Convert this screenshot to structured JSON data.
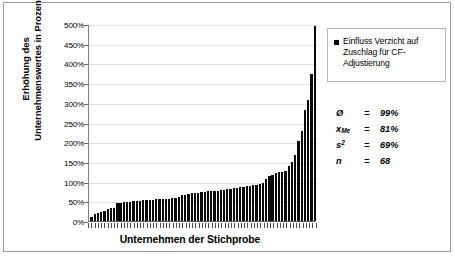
{
  "chart_data": {
    "type": "bar",
    "title": "",
    "xlabel": "Unternehmen der Stichprobe",
    "ylabel_lines": [
      "Erhöhung des",
      "Unternehmenswertes in Prozent"
    ],
    "ylabel": "Erhöhung des Unternehmenswertes in Prozent",
    "ylim": [
      0,
      500
    ],
    "ytick_labels": [
      "500%",
      "450%",
      "400%",
      "350%",
      "300%",
      "250%",
      "200%",
      "150%",
      "100%",
      "50%",
      "0%"
    ],
    "ytick_values": [
      500,
      450,
      400,
      350,
      300,
      250,
      200,
      150,
      100,
      50,
      0
    ],
    "ytick_suffix": "%",
    "grid": true,
    "legend_position": "right",
    "series": [
      {
        "name": "Einfluss Verzicht auf Zuschlag für CF-Adjustierung",
        "color": "#0a0a0a",
        "values": [
          11,
          17,
          21,
          24,
          25,
          31,
          32,
          33,
          45,
          46,
          47,
          48,
          49,
          50,
          51,
          52,
          53,
          53,
          54,
          54,
          55,
          55,
          56,
          56,
          57,
          58,
          59,
          61,
          66,
          67,
          68,
          70,
          71,
          72,
          73,
          74,
          75,
          76,
          76,
          77,
          78,
          79,
          80,
          81,
          83,
          85,
          86,
          87,
          88,
          89,
          91,
          92,
          94,
          97,
          106,
          113,
          118,
          121,
          124,
          125,
          126,
          139,
          151,
          168,
          203,
          228,
          283,
          307,
          372,
          495
        ]
      }
    ],
    "n_bars": 68
  },
  "legend": {
    "entry_label": "Einfluss Verzicht auf Zuschlag für CF-Adjustierung",
    "marker_color": "#000000"
  },
  "stats": {
    "rows": [
      {
        "symbol": "Ø",
        "sub": "",
        "sup": "",
        "equals": "=",
        "value": "99%"
      },
      {
        "symbol": "x",
        "sub": "Me",
        "sup": "",
        "equals": "=",
        "value": "81%"
      },
      {
        "symbol": "s",
        "sub": "",
        "sup": "2",
        "equals": "=",
        "value": "69%"
      },
      {
        "symbol": "n",
        "sub": "",
        "sup": "",
        "equals": "=",
        "value": "68"
      }
    ]
  },
  "axes": {
    "x_title": "Unternehmen der Stichprobe",
    "y_title_line1": "Erhöhung des",
    "y_title_line2": "Unternehmenswertes in Prozent"
  }
}
